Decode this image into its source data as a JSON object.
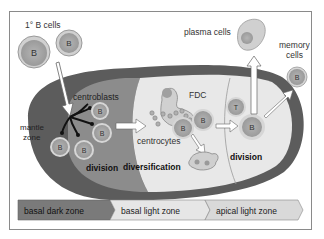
{
  "diagram": {
    "labels": {
      "naive_b_cells": "1° B cells",
      "centroblasts": "centroblasts",
      "mantle_zone_line1": "mantle",
      "mantle_zone_line2": "zone",
      "division_left": "division",
      "diversification": "diversification",
      "centrocytes": "centrocytes",
      "fdc": "FDC",
      "division_right": "division",
      "plasma_cells": "plasma cells",
      "memory_cells_line1": "memory",
      "memory_cells_line2": "cells"
    },
    "cell_labels": {
      "b": "B",
      "t": "T"
    },
    "zones": [
      {
        "label": "basal dark zone",
        "color": "#7a7a7a"
      },
      {
        "label": "basal light zone",
        "color": "#e6e6e6"
      },
      {
        "label": "apical light zone",
        "color": "#d9d9d9"
      }
    ],
    "colors": {
      "outer_ring": "#5c5c5c",
      "dark_zone": "#8c8c8c",
      "light_zone": "#e8e8e8",
      "cell_fill": "#a8a8a8",
      "cell_ring": "#d6d6d6",
      "arrow_fill": "#ffffff"
    }
  }
}
